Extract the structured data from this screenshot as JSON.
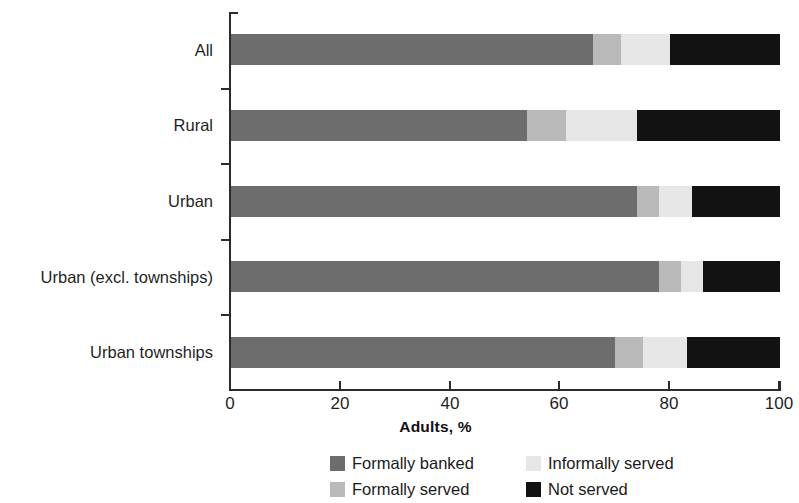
{
  "chart_data": {
    "type": "bar",
    "orientation": "horizontal",
    "stacked": true,
    "title": "",
    "xlabel": "Adults, %",
    "ylabel": "",
    "xlim": [
      0,
      100
    ],
    "xticks": [
      0,
      20,
      40,
      60,
      80,
      100
    ],
    "xtick_labels": [
      "0",
      "20",
      "40",
      "60",
      "80",
      "100"
    ],
    "grid": false,
    "legend_position": "bottom",
    "categories": [
      "All",
      "Rural",
      "Urban",
      "Urban (excl. townships)",
      "Urban townships"
    ],
    "series": [
      {
        "name": "Formally banked",
        "color": "#6d6d6d",
        "values": [
          66,
          54,
          74,
          78,
          70
        ]
      },
      {
        "name": "Formally served",
        "color": "#b9b9b9",
        "values": [
          5,
          7,
          4,
          4,
          5
        ]
      },
      {
        "name": "Informally served",
        "color": "#e6e6e6",
        "values": [
          9,
          13,
          6,
          4,
          8
        ]
      },
      {
        "name": "Not served",
        "color": "#121212",
        "values": [
          20,
          26,
          16,
          14,
          17
        ]
      }
    ],
    "legend_entries": [
      "Formally banked",
      "Informally served",
      "Formally served",
      "Not served"
    ]
  },
  "axis": {
    "x_title": "Adults, %"
  },
  "colors": {
    "formally_banked": "#6d6d6d",
    "formally_served": "#b9b9b9",
    "informally_served": "#e6e6e6",
    "not_served": "#121212",
    "axis": "#2b2b2b",
    "text": "#1a1a1a",
    "background": "#ffffff"
  }
}
